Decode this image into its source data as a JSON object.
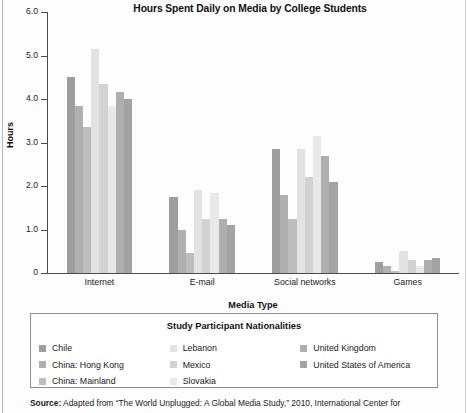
{
  "chart_data": {
    "type": "bar",
    "title": "Hours Spent Daily on Media by College Students",
    "xlabel": "Media Type",
    "ylabel": "Hours",
    "ylim": [
      0,
      6
    ],
    "yticks": [
      "0",
      "1.0",
      "2.0",
      "3.0",
      "4.0",
      "5.0",
      "6.0"
    ],
    "grid": false,
    "legend_position": "bottom",
    "legend_title": "Study Participant Nationalities",
    "categories": [
      "Internet",
      "E-mail",
      "Social networks",
      "Games"
    ],
    "series": [
      {
        "name": "Chile",
        "color": "#9e9e9e",
        "values": [
          4.5,
          1.75,
          2.85,
          0.25
        ]
      },
      {
        "name": "China: Hong Kong",
        "color": "#b0b0b0",
        "values": [
          3.85,
          1.0,
          1.8,
          0.15
        ]
      },
      {
        "name": "China: Mainland",
        "color": "#bdbdbd",
        "values": [
          3.35,
          0.45,
          1.25,
          0.05
        ]
      },
      {
        "name": "Lebanon",
        "color": "#e2e2e2",
        "values": [
          5.15,
          1.9,
          2.85,
          0.5
        ]
      },
      {
        "name": "Mexico",
        "color": "#d2d2d2",
        "values": [
          4.35,
          1.25,
          2.2,
          0.3
        ]
      },
      {
        "name": "Slovakia",
        "color": "#e8e8e8",
        "values": [
          3.85,
          1.85,
          3.15,
          0.15
        ]
      },
      {
        "name": "United Kingdom",
        "color": "#aeaeae",
        "values": [
          4.15,
          1.25,
          2.7,
          0.3
        ]
      },
      {
        "name": "United States of America",
        "color": "#a3a3a3",
        "values": [
          4.0,
          1.1,
          2.1,
          0.35
        ]
      }
    ]
  },
  "legend": {
    "title": "Study Participant Nationalities",
    "columns": [
      [
        "Chile",
        "China: Hong Kong",
        "China: Mainland"
      ],
      [
        "Lebanon",
        "Mexico",
        "Slovakia"
      ],
      [
        "United Kingdom",
        "United States of America"
      ]
    ]
  },
  "source": {
    "label": "Source:",
    "text": " Adapted from “The World Unplugged: A Global Media Study,” 2010, International Center for"
  }
}
